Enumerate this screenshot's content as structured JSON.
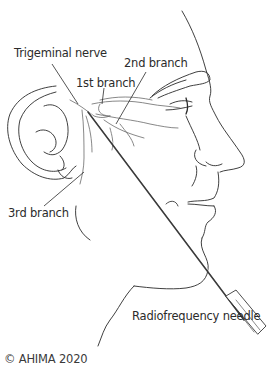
{
  "figure": {
    "labels": {
      "trigeminal_nerve": "Trigeminal nerve",
      "branch_1": "1st branch",
      "branch_2": "2nd branch",
      "branch_3": "3rd branch",
      "needle": "Radiofrequency needle"
    },
    "credit": "© AHIMA 2020",
    "colors": {
      "line": "#2a2a2a",
      "nerve": "#6a6a6a",
      "text": "#2b2b2b",
      "background": "#ffffff"
    }
  }
}
